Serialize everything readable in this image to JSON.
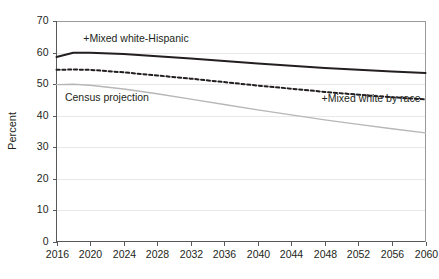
{
  "chart_data": {
    "type": "line",
    "title": "",
    "subtitle": "",
    "xlabel": "",
    "ylabel": "Percent",
    "xlim": [
      2016,
      2060
    ],
    "ylim": [
      0,
      70
    ],
    "grid": true,
    "legend_position": "inline-annotations",
    "x_tick_labels": [
      "2016",
      "2020",
      "2024",
      "2028",
      "2032",
      "2036",
      "2040",
      "2044",
      "2048",
      "2052",
      "2056",
      "2060"
    ],
    "y_tick_labels": [
      "0",
      "10",
      "20",
      "30",
      "40",
      "50",
      "60",
      "70"
    ],
    "x": [
      2016,
      2018,
      2020,
      2024,
      2028,
      2032,
      2036,
      2040,
      2044,
      2048,
      2052,
      2056,
      2060
    ],
    "series": [
      {
        "name": "+Mixed white-Hispanic",
        "color": "#231f20",
        "style": "solid",
        "values": [
          58.6,
          59.9,
          59.9,
          59.5,
          58.8,
          58.1,
          57.3,
          56.5,
          55.8,
          55.1,
          54.5,
          54.0,
          53.5
        ]
      },
      {
        "name": "+Mixed white by race",
        "color": "#231f20",
        "style": "dashed",
        "values": [
          54.5,
          54.6,
          54.5,
          53.7,
          52.7,
          51.7,
          50.6,
          49.5,
          48.5,
          47.5,
          46.6,
          45.8,
          45.1
        ]
      },
      {
        "name": "Census projection",
        "color": "#b7b7b7",
        "style": "solid",
        "values": [
          49.8,
          49.9,
          49.6,
          48.4,
          46.9,
          45.2,
          43.5,
          41.8,
          40.2,
          38.6,
          37.2,
          35.8,
          34.5
        ]
      }
    ],
    "annotations": [
      {
        "text": "+Mixed white-Hispanic",
        "x": 2019.2,
        "y": 63.5,
        "align": "start"
      },
      {
        "text": "Census projection",
        "x": 2017.0,
        "y": 44.6,
        "align": "start"
      },
      {
        "text": "+Mixed white by race",
        "x": 2059.4,
        "y": 44.3,
        "align": "end"
      }
    ]
  }
}
